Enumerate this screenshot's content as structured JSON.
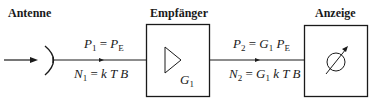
{
  "blocks": {
    "antenna": {
      "label": "Antenne"
    },
    "receiver": {
      "label": "Empfänger",
      "gain_symbol": "G",
      "gain_index": "1"
    },
    "display": {
      "label": "Anzeige"
    }
  },
  "signals": {
    "input": {
      "power": {
        "lhs": "P",
        "lhs_sub": "1",
        "eq": "=",
        "rhs": "P",
        "rhs_sub": "E"
      },
      "noise": {
        "lhs": "N",
        "lhs_sub": "1",
        "eq": "=",
        "rhs": "k T B"
      }
    },
    "output": {
      "power": {
        "lhs": "P",
        "lhs_sub": "2",
        "eq": "=",
        "g": "G",
        "g_sub": "1",
        "rhs": "P",
        "rhs_sub": "E"
      },
      "noise": {
        "lhs": "N",
        "lhs_sub": "2",
        "eq": "=",
        "g": "G",
        "g_sub": "1",
        "rhs": "k T B"
      }
    }
  },
  "colors": {
    "line": "#1a1a1a",
    "background": "#ffffff"
  }
}
